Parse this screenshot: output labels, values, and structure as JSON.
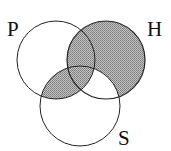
{
  "diagram": {
    "type": "venn",
    "sets": [
      {
        "name": "P",
        "cx": 56,
        "cy": 60,
        "r": 39
      },
      {
        "name": "H",
        "cx": 106,
        "cy": 60,
        "r": 39
      },
      {
        "name": "S",
        "cx": 80,
        "cy": 106,
        "r": 40
      }
    ],
    "labels": {
      "p": "P",
      "h": "H",
      "s": "S"
    },
    "shaded_regions": [
      "H only",
      "P∩H not S",
      "P∩H∩S",
      "P∩S not H"
    ],
    "unshaded_regions": [
      "P only",
      "S only",
      "H∩S not P"
    ],
    "colors": {
      "shade": "#a8a8a8",
      "stroke": "#222222",
      "background": "#ffffff"
    }
  }
}
